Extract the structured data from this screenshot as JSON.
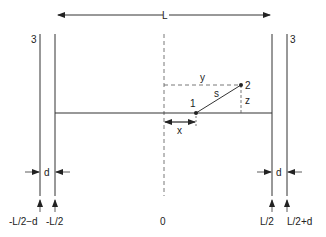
{
  "diagram": {
    "length_label": "L",
    "wall_label_left": "3",
    "wall_label_right": "3",
    "point_1_label": "1",
    "point_2_label": "2",
    "separation_label": "s",
    "y_label": "y",
    "z_label": "z",
    "x_label": "x",
    "thickness_label_left": "d",
    "thickness_label_right": "d",
    "axis_labels": {
      "left_outer": "-L/2−d",
      "left_inner": "-L/2",
      "center": "0",
      "right_inner": "L/2",
      "right_outer": "L/2+d"
    },
    "line_color": "#333333"
  }
}
